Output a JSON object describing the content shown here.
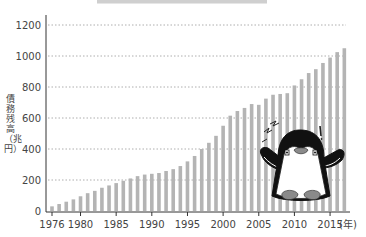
{
  "chart_data": {
    "type": "bar",
    "title": "",
    "xlabel": "(年)",
    "ylabel": "債務残高（兆円）",
    "ylim": [
      0,
      1200
    ],
    "yticks": [
      0,
      200,
      400,
      600,
      800,
      1000,
      1200
    ],
    "xtick_labels": [
      "1976",
      "1980",
      "1985",
      "1990",
      "1995",
      "2000",
      "2005",
      "2010",
      "2015"
    ],
    "grid": "horizontal dotted",
    "legend": null,
    "categories": [
      "1976",
      "1977",
      "1978",
      "1979",
      "1980",
      "1981",
      "1982",
      "1983",
      "1984",
      "1985",
      "1986",
      "1987",
      "1988",
      "1989",
      "1990",
      "1991",
      "1992",
      "1993",
      "1994",
      "1995",
      "1996",
      "1997",
      "1998",
      "1999",
      "2000",
      "2001",
      "2002",
      "2003",
      "2004",
      "2005",
      "2006",
      "2007",
      "2008",
      "2009",
      "2010",
      "2011",
      "2012",
      "2013",
      "2014",
      "2015",
      "2016",
      "2017"
    ],
    "values": [
      30,
      45,
      60,
      75,
      95,
      115,
      130,
      150,
      165,
      180,
      195,
      210,
      225,
      235,
      240,
      245,
      258,
      270,
      290,
      320,
      355,
      400,
      440,
      485,
      550,
      615,
      645,
      665,
      690,
      685,
      725,
      750,
      755,
      760,
      810,
      850,
      890,
      915,
      955,
      990,
      1025,
      1050
    ],
    "bar_color": "#b4b4b4",
    "annotation": "penguin-mascot-illustration (worried, arms raised)"
  },
  "axis": {
    "xunit": "(年)",
    "ylabel": "債務残高（兆円）"
  }
}
